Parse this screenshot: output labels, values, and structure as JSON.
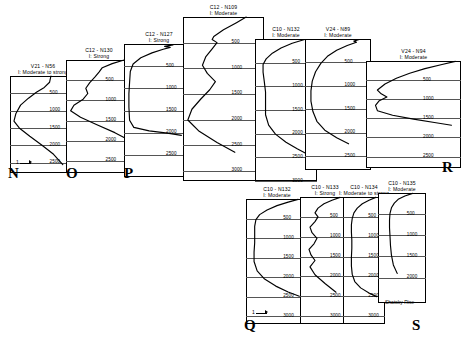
{
  "figure": {
    "background": "#ffffff",
    "line_color": "#000000",
    "grid_color": "#555555",
    "region_label": "Shatsky Rise",
    "scale_label": "1"
  },
  "chart_data": {
    "type": "line",
    "xlabel": "Relative intensity",
    "ylabel": "Depth (m)",
    "grid": true,
    "legend": "none",
    "orientation": "depth-vertical-inverted",
    "panels": [
      {
        "letter": "N",
        "site": "V21 - N56",
        "intensity": "I: Moderate to strong",
        "ylim": [
          0,
          2800
        ],
        "yticks": [
          500,
          1000,
          1500,
          2000,
          2500
        ],
        "x": [
          0.62,
          0.6,
          0.52,
          0.4,
          0.28,
          0.16,
          0.09,
          0.06,
          0.14,
          0.3,
          0.48,
          0.66,
          0.8
        ],
        "y": [
          0,
          180,
          330,
          470,
          640,
          840,
          1080,
          1300,
          1500,
          1740,
          1990,
          2260,
          2560
        ]
      },
      {
        "letter": "O",
        "site": "C12 - N130",
        "intensity": "I: Strong",
        "ylim": [
          0,
          2800
        ],
        "yticks": [
          500,
          1000,
          1500,
          2000,
          2500
        ],
        "x": [
          0.88,
          0.7,
          0.55,
          0.5,
          0.44,
          0.36,
          0.3,
          0.33,
          0.26,
          0.12,
          0.07,
          0.22,
          0.46,
          0.74,
          0.96
        ],
        "y": [
          0,
          90,
          190,
          300,
          420,
          560,
          700,
          830,
          970,
          1120,
          1260,
          1420,
          1600,
          1800,
          1990
        ]
      },
      {
        "letter": "P",
        "site": "C12 - N127",
        "intensity": "I: Strong",
        "ylim": [
          0,
          3000
        ],
        "yticks": [
          500,
          1000,
          1500,
          2000,
          2500
        ],
        "x": [
          0.7,
          0.58,
          0.66,
          0.56,
          0.4,
          0.24,
          0.13,
          0.09,
          0.08,
          0.07,
          0.07,
          0.08,
          0.14,
          0.36,
          0.62,
          0.82
        ],
        "y": [
          20,
          55,
          75,
          120,
          200,
          310,
          450,
          620,
          860,
          1120,
          1420,
          1720,
          1880,
          1960,
          2010,
          2060
        ]
      },
      {
        "letter": "",
        "site": "C12 - N109",
        "intensity": "I: Moderate",
        "ylim": [
          0,
          3200
        ],
        "yticks": [
          500,
          1000,
          1500,
          2000,
          2500,
          3000
        ],
        "x": [
          0.78,
          0.66,
          0.5,
          0.38,
          0.36,
          0.42,
          0.36,
          0.28,
          0.24,
          0.3,
          0.4,
          0.33,
          0.22,
          0.11,
          0.06,
          0.2,
          0.42,
          0.64
        ],
        "y": [
          0,
          110,
          250,
          380,
          440,
          500,
          620,
          780,
          940,
          1100,
          1260,
          1420,
          1600,
          1800,
          2010,
          2230,
          2450,
          2640
        ]
      },
      {
        "letter": "",
        "site": "C10 - N132",
        "intensity": "I: Moderate",
        "ylim": [
          0,
          3000
        ],
        "yticks": [
          500,
          1000,
          1500,
          2000,
          2500,
          3000
        ],
        "x": [
          0.8,
          0.6,
          0.42,
          0.28,
          0.18,
          0.13,
          0.13,
          0.15,
          0.17,
          0.17,
          0.17,
          0.22,
          0.33,
          0.5,
          0.68,
          0.84
        ],
        "y": [
          10,
          90,
          190,
          300,
          420,
          540,
          700,
          900,
          1120,
          1360,
          1600,
          1820,
          2010,
          2180,
          2320,
          2430
        ]
      },
      {
        "letter": "",
        "site": "V24 - N89",
        "intensity": "I: Moderate",
        "ylim": [
          0,
          2800
        ],
        "yticks": [
          500,
          1000,
          1500,
          2000,
          2500
        ],
        "x": [
          0.82,
          0.74,
          0.78,
          0.64,
          0.48,
          0.34,
          0.24,
          0.16,
          0.11,
          0.09,
          0.09,
          0.12,
          0.18,
          0.3,
          0.48,
          0.66
        ],
        "y": [
          10,
          45,
          70,
          140,
          240,
          370,
          520,
          700,
          900,
          1110,
          1330,
          1550,
          1760,
          1950,
          2110,
          2240
        ]
      },
      {
        "letter": "R",
        "site": "V24 - N94",
        "intensity": "I: Moderate",
        "ylim": [
          0,
          2800
        ],
        "yticks": [
          500,
          1000,
          1500,
          2000,
          2500
        ],
        "x": [
          0.94,
          0.8,
          0.62,
          0.46,
          0.32,
          0.2,
          0.12,
          0.16,
          0.22,
          0.14,
          0.1,
          0.12,
          0.28,
          0.5,
          0.72,
          0.9
        ],
        "y": [
          10,
          90,
          200,
          320,
          450,
          600,
          760,
          860,
          940,
          1040,
          1160,
          1300,
          1420,
          1520,
          1610,
          1680
        ]
      },
      {
        "letter": "Q",
        "site": "C10 - N132",
        "intensity": "I: Moderate",
        "ylim": [
          0,
          3200
        ],
        "yticks": [
          500,
          1000,
          1500,
          2000,
          2500,
          3000
        ],
        "x": [
          0.84,
          0.68,
          0.5,
          0.34,
          0.22,
          0.16,
          0.14,
          0.14,
          0.14,
          0.13,
          0.13,
          0.18,
          0.3,
          0.48,
          0.68,
          0.86
        ],
        "y": [
          10,
          80,
          170,
          280,
          400,
          530,
          700,
          900,
          1120,
          1360,
          1600,
          1840,
          2050,
          2230,
          2380,
          2490
        ]
      },
      {
        "letter": "",
        "site": "C10 - N133",
        "intensity": "I: Strong",
        "ylim": [
          0,
          3200
        ],
        "yticks": [
          500,
          1000,
          1500,
          2000,
          2500,
          3000
        ],
        "x": [
          0.8,
          0.64,
          0.48,
          0.36,
          0.3,
          0.36,
          0.3,
          0.2,
          0.24,
          0.34,
          0.28,
          0.18,
          0.22,
          0.3,
          0.2,
          0.3,
          0.5,
          0.72
        ],
        "y": [
          10,
          80,
          170,
          280,
          400,
          500,
          620,
          760,
          900,
          1040,
          1180,
          1320,
          1460,
          1600,
          1760,
          1960,
          2180,
          2400
        ]
      },
      {
        "letter": "",
        "site": "C10 - N134",
        "intensity": "I: Moderate to strong",
        "ylim": [
          0,
          3200
        ],
        "yticks": [
          500,
          1000,
          1500,
          2000,
          2500,
          3000
        ],
        "x": [
          0.78,
          0.62,
          0.46,
          0.34,
          0.26,
          0.22,
          0.2,
          0.2,
          0.21,
          0.21,
          0.2,
          0.2,
          0.22,
          0.28,
          0.42,
          0.62,
          0.8
        ],
        "y": [
          10,
          80,
          170,
          280,
          400,
          540,
          700,
          880,
          1080,
          1300,
          1520,
          1740,
          1950,
          2130,
          2290,
          2420,
          2510
        ]
      },
      {
        "letter": "S",
        "site": "C10 - N135",
        "intensity": "I: Moderate",
        "ylim": [
          0,
          2600
        ],
        "yticks": [
          500,
          1000,
          1500,
          2000
        ],
        "x": [
          0.72,
          0.56,
          0.42,
          0.34,
          0.28,
          0.25,
          0.24,
          0.24,
          0.25,
          0.26,
          0.28,
          0.32,
          0.4
        ],
        "y": [
          10,
          70,
          150,
          240,
          350,
          480,
          640,
          820,
          1020,
          1240,
          1470,
          1700,
          1900
        ]
      }
    ]
  },
  "panel_letters": [
    "N",
    "O",
    "P",
    "R",
    "Q",
    "S"
  ]
}
